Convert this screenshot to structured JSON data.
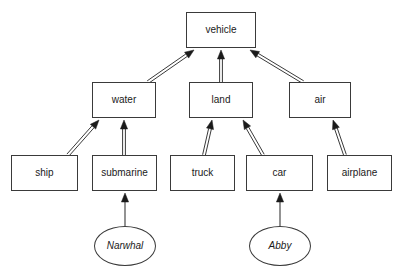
{
  "diagram": {
    "type": "class-generalization-hierarchy",
    "background_color": "#ffffff",
    "stroke_color": "#3a3a3a",
    "arrow_fill_color": "#1a1a1a",
    "canvas": {
      "width": 400,
      "height": 279
    },
    "nodes": [
      {
        "id": "vehicle",
        "label": "vehicle",
        "shape": "rect",
        "x": 186,
        "y": 12,
        "w": 70,
        "h": 36,
        "style": "normal"
      },
      {
        "id": "water",
        "label": "water",
        "shape": "rect",
        "x": 92,
        "y": 82,
        "w": 64,
        "h": 36,
        "style": "normal"
      },
      {
        "id": "land",
        "label": "land",
        "shape": "rect",
        "x": 189,
        "y": 82,
        "w": 64,
        "h": 36,
        "style": "normal"
      },
      {
        "id": "air",
        "label": "air",
        "shape": "rect",
        "x": 289,
        "y": 82,
        "w": 62,
        "h": 36,
        "style": "normal"
      },
      {
        "id": "ship",
        "label": "ship",
        "shape": "rect",
        "x": 11,
        "y": 155,
        "w": 67,
        "h": 36,
        "style": "normal"
      },
      {
        "id": "submarine",
        "label": "submarine",
        "shape": "rect",
        "x": 92,
        "y": 155,
        "w": 65,
        "h": 36,
        "style": "normal"
      },
      {
        "id": "truck",
        "label": "truck",
        "shape": "rect",
        "x": 170,
        "y": 155,
        "w": 65,
        "h": 36,
        "style": "normal"
      },
      {
        "id": "car",
        "label": "car",
        "shape": "rect",
        "x": 246,
        "y": 155,
        "w": 67,
        "h": 36,
        "style": "normal"
      },
      {
        "id": "airplane",
        "label": "airplane",
        "shape": "rect",
        "x": 327,
        "y": 155,
        "w": 65,
        "h": 36,
        "style": "normal"
      },
      {
        "id": "narwhal",
        "label": "Narwhal",
        "shape": "ellipse",
        "x": 94,
        "y": 226,
        "w": 62,
        "h": 40,
        "style": "italic"
      },
      {
        "id": "abby",
        "label": "Abby",
        "shape": "ellipse",
        "x": 249,
        "y": 226,
        "w": 62,
        "h": 40,
        "style": "italic"
      }
    ],
    "edges": [
      {
        "id": "water-vehicle",
        "from": "water",
        "to": "vehicle",
        "kind": "generalization",
        "x1": 148,
        "y1": 82,
        "x2": 194,
        "y2": 50
      },
      {
        "id": "land-vehicle",
        "from": "land",
        "to": "vehicle",
        "kind": "generalization",
        "x1": 221,
        "y1": 82,
        "x2": 221,
        "y2": 50
      },
      {
        "id": "air-vehicle",
        "from": "air",
        "to": "vehicle",
        "kind": "generalization",
        "x1": 303,
        "y1": 82,
        "x2": 250,
        "y2": 50
      },
      {
        "id": "ship-water",
        "from": "ship",
        "to": "water",
        "kind": "generalization",
        "x1": 68,
        "y1": 155,
        "x2": 99,
        "y2": 120
      },
      {
        "id": "submarine-water",
        "from": "submarine",
        "to": "water",
        "kind": "generalization",
        "x1": 124,
        "y1": 155,
        "x2": 124,
        "y2": 120
      },
      {
        "id": "truck-land",
        "from": "truck",
        "to": "land",
        "kind": "generalization",
        "x1": 204,
        "y1": 155,
        "x2": 212,
        "y2": 120
      },
      {
        "id": "car-land",
        "from": "car",
        "to": "land",
        "kind": "generalization",
        "x1": 263,
        "y1": 155,
        "x2": 243,
        "y2": 120
      },
      {
        "id": "airplane-air",
        "from": "airplane",
        "to": "air",
        "kind": "generalization",
        "x1": 345,
        "y1": 155,
        "x2": 333,
        "y2": 120
      },
      {
        "id": "narwhal-submarine",
        "from": "narwhal",
        "to": "submarine",
        "kind": "instance-of",
        "x1": 125,
        "y1": 226,
        "x2": 125,
        "y2": 193
      },
      {
        "id": "abby-car",
        "from": "abby",
        "to": "car",
        "kind": "instance-of",
        "x1": 280,
        "y1": 226,
        "x2": 280,
        "y2": 193
      }
    ]
  }
}
